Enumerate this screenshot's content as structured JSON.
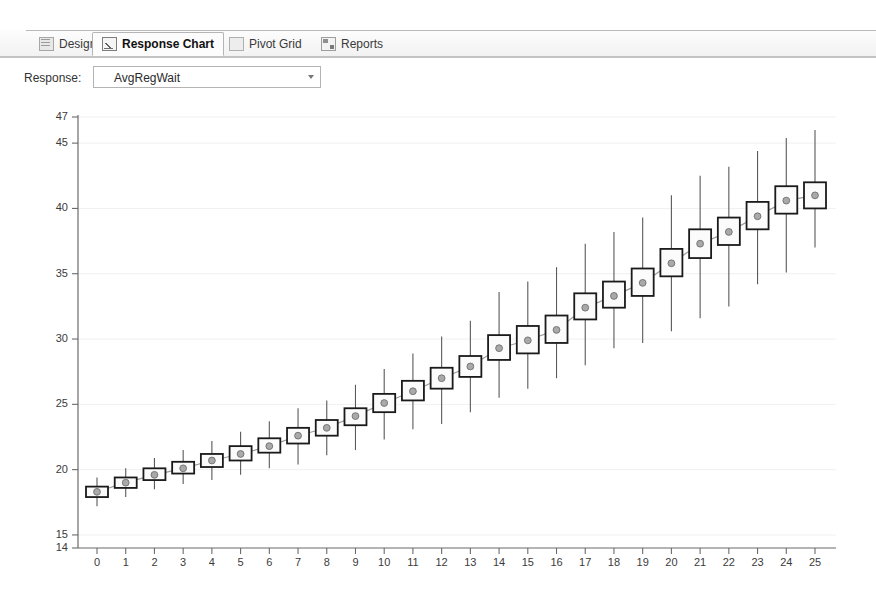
{
  "window": {
    "tabs": [
      {
        "label": "Design",
        "icon": "grid-icon",
        "active": false
      },
      {
        "label": "Response Chart",
        "icon": "chart-icon",
        "active": true
      },
      {
        "label": "Pivot Grid",
        "icon": "pivot-icon",
        "active": false
      },
      {
        "label": "Reports",
        "icon": "report-icon",
        "active": false
      }
    ]
  },
  "toolbar": {
    "response_label": "Response:",
    "response_value": "AvgRegWait",
    "dropdown_icon": "chevron-down-icon"
  },
  "chart_data": {
    "type": "box",
    "title": "",
    "xlabel": "",
    "ylabel": "",
    "xlim": [
      -0.6,
      25.6
    ],
    "ylim": [
      14,
      47
    ],
    "grid": true,
    "legend": null,
    "y_ticks": [
      14,
      15,
      20,
      25,
      30,
      35,
      40,
      45,
      47
    ],
    "x_ticks": [
      0,
      1,
      2,
      3,
      4,
      5,
      6,
      7,
      8,
      9,
      10,
      11,
      12,
      13,
      14,
      15,
      16,
      17,
      18,
      19,
      20,
      21,
      22,
      23,
      24,
      25
    ],
    "series_name": "AvgRegWait",
    "boxes": [
      {
        "x": 0,
        "low": 17.2,
        "q1": 17.9,
        "median": 18.3,
        "q3": 18.7,
        "high": 19.4
      },
      {
        "x": 1,
        "low": 17.9,
        "q1": 18.6,
        "median": 19.0,
        "q3": 19.4,
        "high": 20.1
      },
      {
        "x": 2,
        "low": 18.5,
        "q1": 19.2,
        "median": 19.6,
        "q3": 20.1,
        "high": 20.9
      },
      {
        "x": 3,
        "low": 18.9,
        "q1": 19.7,
        "median": 20.1,
        "q3": 20.6,
        "high": 21.5
      },
      {
        "x": 4,
        "low": 19.2,
        "q1": 20.2,
        "median": 20.7,
        "q3": 21.2,
        "high": 22.2
      },
      {
        "x": 5,
        "low": 19.6,
        "q1": 20.7,
        "median": 21.2,
        "q3": 21.8,
        "high": 22.9
      },
      {
        "x": 6,
        "low": 20.1,
        "q1": 21.3,
        "median": 21.8,
        "q3": 22.4,
        "high": 23.7
      },
      {
        "x": 7,
        "low": 20.4,
        "q1": 22.0,
        "median": 22.6,
        "q3": 23.2,
        "high": 24.7
      },
      {
        "x": 8,
        "low": 21.1,
        "q1": 22.6,
        "median": 23.2,
        "q3": 23.8,
        "high": 25.3
      },
      {
        "x": 9,
        "low": 21.5,
        "q1": 23.4,
        "median": 24.1,
        "q3": 24.7,
        "high": 26.5
      },
      {
        "x": 10,
        "low": 22.3,
        "q1": 24.4,
        "median": 25.1,
        "q3": 25.8,
        "high": 27.7
      },
      {
        "x": 11,
        "low": 23.1,
        "q1": 25.3,
        "median": 26.0,
        "q3": 26.8,
        "high": 28.9
      },
      {
        "x": 12,
        "low": 23.5,
        "q1": 26.2,
        "median": 27.0,
        "q3": 27.8,
        "high": 30.2
      },
      {
        "x": 13,
        "low": 24.4,
        "q1": 27.1,
        "median": 27.9,
        "q3": 28.7,
        "high": 31.4
      },
      {
        "x": 14,
        "low": 25.5,
        "q1": 28.4,
        "median": 29.3,
        "q3": 30.3,
        "high": 33.6
      },
      {
        "x": 15,
        "low": 26.2,
        "q1": 28.9,
        "median": 29.9,
        "q3": 31.0,
        "high": 34.4
      },
      {
        "x": 16,
        "low": 27.0,
        "q1": 29.7,
        "median": 30.7,
        "q3": 31.8,
        "high": 35.5
      },
      {
        "x": 17,
        "low": 28.0,
        "q1": 31.5,
        "median": 32.4,
        "q3": 33.5,
        "high": 37.3
      },
      {
        "x": 18,
        "low": 29.3,
        "q1": 32.4,
        "median": 33.3,
        "q3": 34.4,
        "high": 38.2
      },
      {
        "x": 19,
        "low": 29.7,
        "q1": 33.3,
        "median": 34.3,
        "q3": 35.4,
        "high": 39.3
      },
      {
        "x": 20,
        "low": 30.6,
        "q1": 34.8,
        "median": 35.8,
        "q3": 36.9,
        "high": 41.0
      },
      {
        "x": 21,
        "low": 31.6,
        "q1": 36.2,
        "median": 37.3,
        "q3": 38.4,
        "high": 42.5
      },
      {
        "x": 22,
        "low": 32.5,
        "q1": 37.2,
        "median": 38.2,
        "q3": 39.3,
        "high": 43.2
      },
      {
        "x": 23,
        "low": 34.2,
        "q1": 38.4,
        "median": 39.4,
        "q3": 40.5,
        "high": 44.4
      },
      {
        "x": 24,
        "low": 35.1,
        "q1": 39.6,
        "median": 40.6,
        "q3": 41.7,
        "high": 45.4
      },
      {
        "x": 25,
        "low": 37.0,
        "q1": 40.0,
        "median": 41.0,
        "q3": 42.0,
        "high": 46.0
      }
    ]
  }
}
